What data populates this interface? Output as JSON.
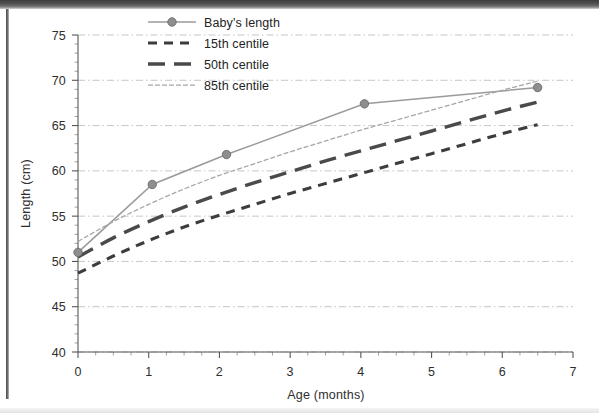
{
  "figure": {
    "background_color": "#ffffff",
    "ink_color": "#2e2e2e"
  },
  "chart_data": {
    "type": "line",
    "title": "",
    "subtitle": "",
    "xlabel": "Age (months)",
    "ylabel": "Length (cm)",
    "xlim": [
      0,
      7
    ],
    "ylim": [
      40,
      75
    ],
    "xticks": [
      0,
      1,
      2,
      3,
      4,
      5,
      6,
      7
    ],
    "xticklabels": [
      "0",
      "1",
      "2",
      "3",
      "4",
      "5",
      "6",
      "7"
    ],
    "yticks": [
      40,
      45,
      50,
      55,
      60,
      65,
      70,
      75
    ],
    "yticklabels": [
      "40",
      "45",
      "50",
      "55",
      "60",
      "65",
      "70",
      "75"
    ],
    "x_minor_tick_step": 0.25,
    "y_minor_tick_step": 1,
    "grid": true,
    "grid_axis": "y",
    "grid_style": "dash-dot",
    "legend_position": "top-center",
    "series": [
      {
        "name": "Baby's length",
        "style": "solid-with-markers",
        "color": "#9a9a9a",
        "marker": "circle",
        "x": [
          0,
          1.05,
          2.1,
          4.05,
          6.5
        ],
        "y": [
          51.0,
          58.5,
          61.8,
          67.4,
          69.2
        ]
      },
      {
        "name": "15th centile",
        "style": "short-dash",
        "color": "#3d3d3d",
        "x": [
          0,
          0.5,
          1,
          1.5,
          2,
          2.5,
          3,
          3.5,
          4,
          4.5,
          5,
          5.5,
          6,
          6.5
        ],
        "y": [
          48.7,
          50.6,
          52.3,
          53.8,
          55.1,
          56.3,
          57.5,
          58.6,
          59.7,
          60.8,
          61.9,
          63.0,
          64.1,
          65.1
        ]
      },
      {
        "name": "50th centile",
        "style": "long-dash",
        "color": "#4a4a4a",
        "x": [
          0,
          0.5,
          1,
          1.5,
          2,
          2.5,
          3,
          3.5,
          4,
          4.5,
          5,
          5.5,
          6,
          6.5
        ],
        "y": [
          50.5,
          52.6,
          54.4,
          56.0,
          57.4,
          58.7,
          59.9,
          61.1,
          62.2,
          63.3,
          64.4,
          65.5,
          66.6,
          67.6
        ]
      },
      {
        "name": "85th centile",
        "style": "fine-dot",
        "color": "#a6a6a6",
        "x": [
          0,
          0.5,
          1,
          1.5,
          2,
          2.5,
          3,
          3.5,
          4,
          4.5,
          5,
          5.5,
          6,
          6.5
        ],
        "y": [
          52.2,
          54.4,
          56.3,
          58.0,
          59.5,
          60.8,
          62.1,
          63.3,
          64.5,
          65.6,
          66.7,
          67.8,
          68.9,
          69.9
        ]
      }
    ],
    "legend": [
      {
        "label": "Baby's length",
        "style": "solid-with-markers",
        "color": "#9a9a9a"
      },
      {
        "label": "15th centile",
        "style": "short-dash",
        "color": "#3d3d3d"
      },
      {
        "label": "50th centile",
        "style": "long-dash",
        "color": "#4a4a4a"
      },
      {
        "label": "85th centile",
        "style": "fine-dot",
        "color": "#a6a6a6"
      }
    ]
  }
}
